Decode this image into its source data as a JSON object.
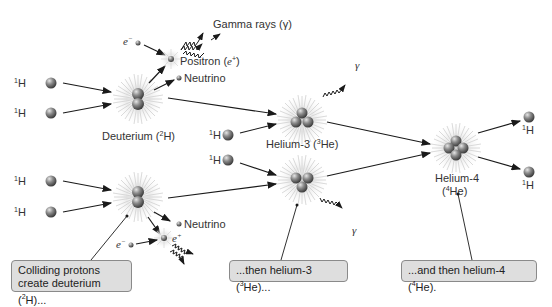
{
  "particles": {
    "hydrogen": "H",
    "hydrogen_mass": "1",
    "electron": "e",
    "electron_sign": "−",
    "positron_symbol_sign": "+"
  },
  "labels": {
    "gamma_rays": "Gamma rays (γ)",
    "positron": "Positron (",
    "positron_symbol": "e",
    "positron_sup": "+",
    "positron_close": ")",
    "neutrino_top": "Neutrino",
    "neutrino_bottom": "Neutrino",
    "deuterium": "Deuterium (",
    "deuterium_sup": "2",
    "deuterium_sym": "H)",
    "helium3": "Helium-3 (",
    "helium3_sup": "3",
    "helium3_sym": "He)",
    "helium4_line1": "Helium-4",
    "helium4_open": "(",
    "helium4_sup": "4",
    "helium4_sym": "He)",
    "gamma_symbol": "γ",
    "e_plus": "e"
  },
  "callouts": [
    {
      "line1": "Colliding protons",
      "line2a": "create deuterium (",
      "sup": "2",
      "line2b": "H)..."
    },
    {
      "text_a": "...then helium-3 (",
      "sup": "3",
      "text_b": "He)..."
    },
    {
      "text_a": "...and then helium-4 (",
      "sup": "4",
      "text_b": "He)."
    }
  ],
  "colors": {
    "particle": "#7a7a7a",
    "glow": "#d9d9d9",
    "arrow": "#1a1a1a",
    "callout_bg": "#dedede",
    "callout_border": "#8a8a8a"
  }
}
